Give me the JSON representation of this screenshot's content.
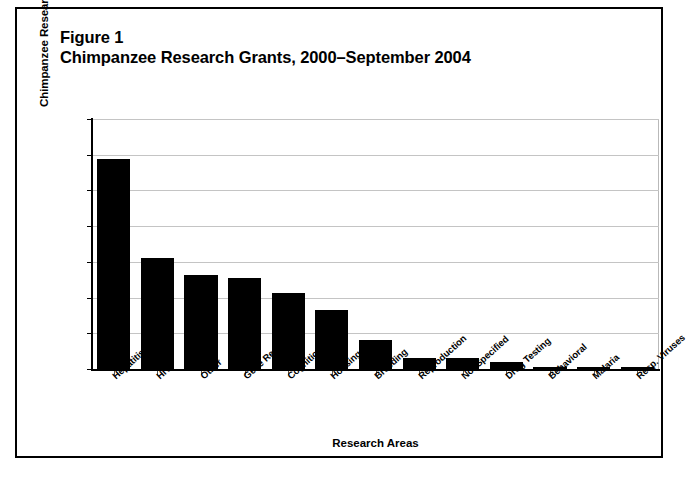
{
  "figure": {
    "label": "Figure 1",
    "title": "Chimpanzee Research Grants, 2000–September 2004"
  },
  "chart_data": {
    "type": "bar",
    "title": "Chimpanzee Research Grants, 2000–September 2004",
    "xlabel": "Research Areas",
    "ylabel": "Chimpanzee Research Grants, by Percentage",
    "ylim": [
      0,
      35
    ],
    "yticks": [
      0,
      5,
      10,
      15,
      20,
      25,
      30,
      35
    ],
    "grid": true,
    "legend": "none",
    "bar_color": "#000000",
    "categories": [
      "Hepatitis Viruses",
      "HIV",
      "Other",
      "Gene Research",
      "Cognition",
      "Housing",
      "Breeding",
      "Reproduction",
      "Not Specified",
      "Drug Testing",
      "Behavioral",
      "Malaria",
      "Resp. Viruses"
    ],
    "values": [
      29.4,
      15.5,
      13.1,
      12.8,
      10.7,
      8.3,
      4.0,
      1.6,
      1.6,
      1.0,
      0.25,
      0.25,
      0.25
    ]
  }
}
